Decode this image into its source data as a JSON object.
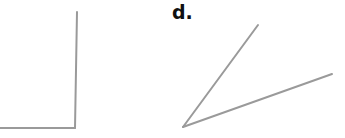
{
  "figures": [
    {
      "id": "c",
      "label": "",
      "shape": "right-angle",
      "stroke_color": "#9a9a9a",
      "lines": [
        {
          "x1": 77,
          "y1": 12,
          "x2": 75,
          "y2": 128
        },
        {
          "x1": 0,
          "y1": 128,
          "x2": 75,
          "y2": 128
        }
      ]
    },
    {
      "id": "d",
      "label": "d.",
      "shape": "acute-angle",
      "stroke_color": "#9a9a9a",
      "vertex": {
        "x": 183,
        "y": 127
      },
      "lines": [
        {
          "x1": 183,
          "y1": 127,
          "x2": 258,
          "y2": 25
        },
        {
          "x1": 183,
          "y1": 127,
          "x2": 332,
          "y2": 74
        }
      ]
    }
  ]
}
